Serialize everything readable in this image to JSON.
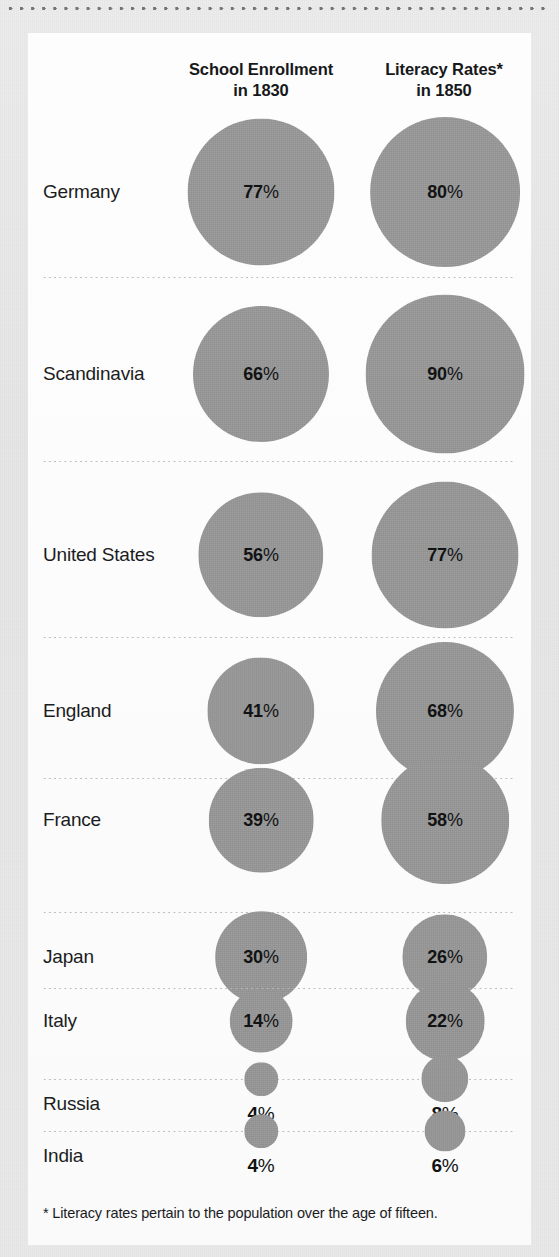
{
  "card": {
    "footnote": "* Literacy rates pertain to the population over the age of fifteen."
  },
  "headers": {
    "enrollment": {
      "line1": "School Enrollment",
      "line2": "in 1830"
    },
    "literacy": {
      "line1": "Literacy Rates*",
      "line2": "in 1850"
    }
  },
  "rows": [
    {
      "country": "Germany",
      "enrollment": "77",
      "literacy": "80",
      "enrollment_label": "77%",
      "literacy_label": "80%"
    },
    {
      "country": "Scandinavia",
      "enrollment": "66",
      "literacy": "90",
      "enrollment_label": "66%",
      "literacy_label": "90%"
    },
    {
      "country": "United States",
      "enrollment": "56",
      "literacy": "77",
      "enrollment_label": "56%",
      "literacy_label": "77%"
    },
    {
      "country": "England",
      "enrollment": "41",
      "literacy": "68",
      "enrollment_label": "41%",
      "literacy_label": "68%"
    },
    {
      "country": "France",
      "enrollment": "39",
      "literacy": "58",
      "enrollment_label": "39%",
      "literacy_label": "58%"
    },
    {
      "country": "Japan",
      "enrollment": "30",
      "literacy": "26",
      "enrollment_label": "30%",
      "literacy_label": "26%"
    },
    {
      "country": "Italy",
      "enrollment": "14",
      "literacy": "22",
      "enrollment_label": "14%",
      "literacy_label": "22%"
    },
    {
      "country": "Russia",
      "enrollment": "4",
      "literacy": "8",
      "enrollment_label": "4%",
      "literacy_label": "8%"
    },
    {
      "country": "India",
      "enrollment": "4",
      "literacy": "6",
      "enrollment_label": "4%",
      "literacy_label": "6%"
    }
  ],
  "colors": {
    "bubble": "#989898",
    "page_background": "#e9e9e9",
    "card_background": "#fdfdfd",
    "text": "#1b1c1e",
    "divider": "#b9bcc2"
  },
  "chart_data": {
    "type": "bubble",
    "title": "",
    "categories": [
      "Germany",
      "Scandinavia",
      "United States",
      "England",
      "France",
      "Japan",
      "Italy",
      "Russia",
      "India"
    ],
    "series": [
      {
        "name": "School Enrollment in 1830",
        "values": [
          77,
          66,
          56,
          41,
          39,
          30,
          14,
          4,
          4
        ]
      },
      {
        "name": "Literacy Rates* in 1850",
        "values": [
          80,
          90,
          77,
          68,
          58,
          26,
          22,
          8,
          6
        ]
      }
    ],
    "unit": "%",
    "encoding": "circle area proportional to percentage",
    "xlabel": "",
    "ylabel": "",
    "grid": false,
    "legend": "column headers",
    "annotations": [
      "* Literacy rates pertain to the population over the age of fifteen."
    ]
  }
}
